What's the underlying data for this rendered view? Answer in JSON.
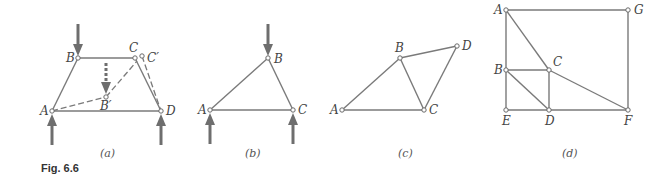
{
  "figure": {
    "caption": "Fig. 6.6",
    "stroke_color": "#7a7a7a",
    "arrow_color": "#6e6e6e"
  },
  "panels": [
    {
      "id": "a",
      "sublabel": "(a)",
      "joints": [
        {
          "name": "A",
          "label": "A"
        },
        {
          "name": "B",
          "label": "B"
        },
        {
          "name": "C",
          "label": "C"
        },
        {
          "name": "D",
          "label": "D"
        },
        {
          "name": "B'",
          "label": "B′"
        },
        {
          "name": "C'",
          "label": "C′"
        }
      ],
      "members": [
        "AB",
        "BC",
        "CD",
        "AD"
      ],
      "dashed_members": [
        "AB'",
        "B'C'",
        "C'D"
      ],
      "loads": [
        "down at B",
        "dashed down at B'",
        "up at A",
        "up at D"
      ]
    },
    {
      "id": "b",
      "sublabel": "(b)",
      "joints": [
        {
          "name": "A",
          "label": "A"
        },
        {
          "name": "B",
          "label": "B"
        },
        {
          "name": "C",
          "label": "C"
        }
      ],
      "members": [
        "AB",
        "BC",
        "AC"
      ],
      "loads": [
        "down at B",
        "up at A",
        "up at C"
      ]
    },
    {
      "id": "c",
      "sublabel": "(c)",
      "joints": [
        {
          "name": "A",
          "label": "A"
        },
        {
          "name": "B",
          "label": "B"
        },
        {
          "name": "C",
          "label": "C"
        },
        {
          "name": "D",
          "label": "D"
        }
      ],
      "members": [
        "AB",
        "AC",
        "BC",
        "BD",
        "CD"
      ]
    },
    {
      "id": "d",
      "sublabel": "(d)",
      "joints": [
        {
          "name": "A",
          "label": "A"
        },
        {
          "name": "B",
          "label": "B"
        },
        {
          "name": "C",
          "label": "C"
        },
        {
          "name": "D",
          "label": "D"
        },
        {
          "name": "E",
          "label": "E"
        },
        {
          "name": "F",
          "label": "F"
        },
        {
          "name": "G",
          "label": "G"
        }
      ],
      "members": [
        "AG",
        "GF",
        "AB",
        "BE",
        "ED",
        "DF",
        "BC",
        "CD",
        "AC",
        "CF",
        "BD"
      ]
    }
  ]
}
